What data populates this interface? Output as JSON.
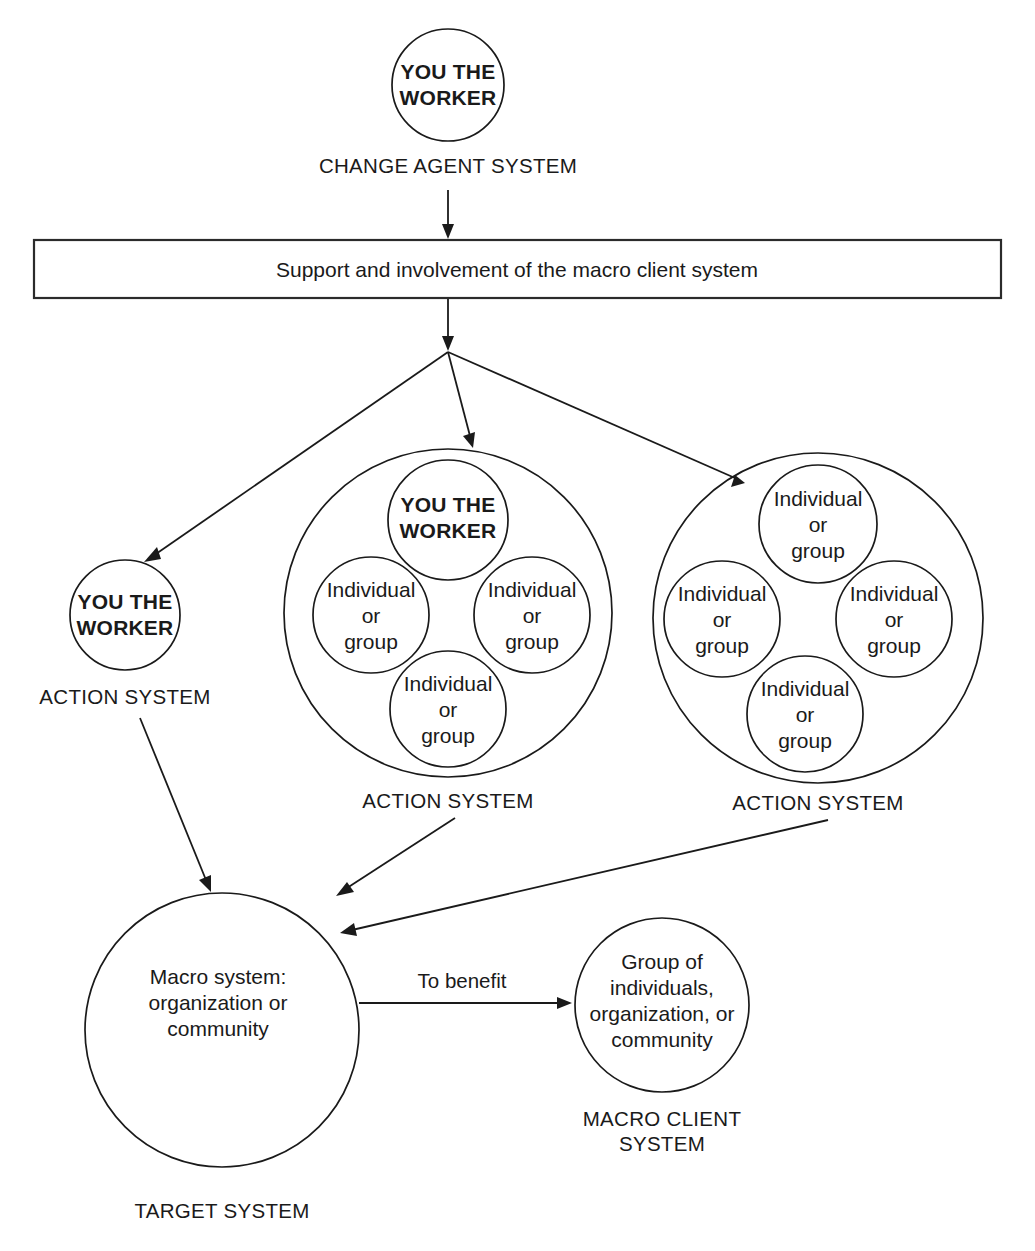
{
  "diagram": {
    "colors": {
      "stroke": "#1a1a1a",
      "background": "#ffffff",
      "box_stroke": "#2b2b2b"
    },
    "change_agent": {
      "circle_label": "YOU THE\nWORKER",
      "caption": "CHANGE AGENT SYSTEM"
    },
    "banner": {
      "text": "Support and involvement of the macro client system"
    },
    "action_system_left": {
      "circle_label": "YOU THE\nWORKER",
      "caption": "ACTION SYSTEM"
    },
    "action_system_middle": {
      "caption": "ACTION SYSTEM",
      "members": [
        {
          "label": "YOU THE\nWORKER",
          "bold": true
        },
        {
          "label": "Individual\nor\ngroup",
          "bold": false
        },
        {
          "label": "Individual\nor\ngroup",
          "bold": false
        },
        {
          "label": "Individual\nor\ngroup",
          "bold": false
        }
      ]
    },
    "action_system_right": {
      "caption": "ACTION SYSTEM",
      "members": [
        {
          "label": "Individual\nor\ngroup",
          "bold": false
        },
        {
          "label": "Individual\nor\ngroup",
          "bold": false
        },
        {
          "label": "Individual\nor\ngroup",
          "bold": false
        },
        {
          "label": "Individual\nor\ngroup",
          "bold": false
        }
      ]
    },
    "target_system": {
      "circle_label": "Macro system:\norganization or\ncommunity",
      "caption": "TARGET SYSTEM"
    },
    "macro_client_system": {
      "circle_label": "Group of\nindividuals,\norganization, or\ncommunity",
      "caption": "MACRO CLIENT\nSYSTEM"
    },
    "edges": {
      "to_benefit": "To benefit"
    }
  }
}
